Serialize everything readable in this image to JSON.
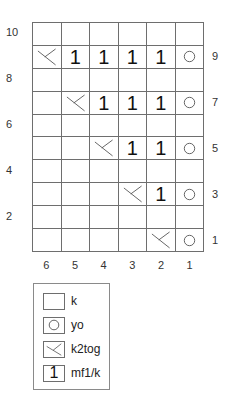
{
  "chart": {
    "columns": 6,
    "rows": 10,
    "left_row_labels": [
      "10",
      "8",
      "6",
      "4",
      "2"
    ],
    "right_row_labels": [
      "9",
      "7",
      "5",
      "3",
      "1"
    ],
    "column_labels": [
      "6",
      "5",
      "4",
      "3",
      "2",
      "1"
    ],
    "grid_top_to_bottom": [
      [
        "",
        "",
        "",
        "",
        "",
        ""
      ],
      [
        "k2tog",
        "1",
        "1",
        "1",
        "1",
        "yo"
      ],
      [
        "",
        "",
        "",
        "",
        "",
        ""
      ],
      [
        "",
        "k2tog",
        "1",
        "1",
        "1",
        "yo"
      ],
      [
        "",
        "",
        "",
        "",
        "",
        ""
      ],
      [
        "",
        "",
        "k2tog",
        "1",
        "1",
        "yo"
      ],
      [
        "",
        "",
        "",
        "",
        "",
        ""
      ],
      [
        "",
        "",
        "",
        "k2tog",
        "1",
        "yo"
      ],
      [
        "",
        "",
        "",
        "",
        "",
        ""
      ],
      [
        "",
        "",
        "",
        "",
        "k2tog",
        "yo"
      ]
    ],
    "mf1_glyph": "1"
  },
  "legend": {
    "items": [
      {
        "symbol": "empty",
        "label": "k"
      },
      {
        "symbol": "yo",
        "label": "yo"
      },
      {
        "symbol": "k2tog",
        "label": "k2tog"
      },
      {
        "symbol": "1",
        "label": "mf1/k"
      }
    ]
  },
  "colors": {
    "grid_line": "#6e6e6e",
    "symbol": "#111111",
    "label": "#333333"
  }
}
